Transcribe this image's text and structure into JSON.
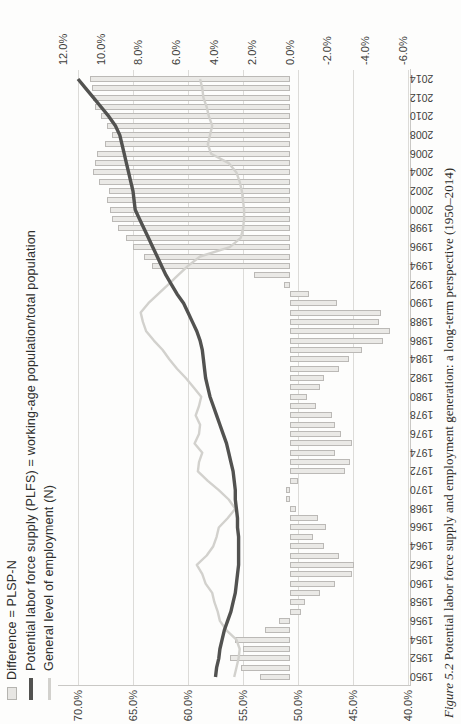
{
  "figure": {
    "caption_label": "Figure 5.2",
    "caption_text": "Potential labor force supply and employment generation: a long-term perspective (1950–2014)"
  },
  "legend": [
    {
      "label": "Difference = PLSP-N",
      "marker": "bar-swatch"
    },
    {
      "label": "Potential labor force supply (PLFS) = working-age population/total population",
      "marker": "thick-line"
    },
    {
      "label": "General level of employment (N)",
      "marker": "thin-line"
    }
  ],
  "chart_data": {
    "type": "bar",
    "subtype": "bar-line-combo",
    "orientation": "figure rotated 90deg counter-clockwise on portrait book page",
    "title": "",
    "xlabel": "",
    "ylabel_left": "",
    "ylabel_right": "",
    "grid": "vertical gridlines at left-axis ticks only",
    "legend_position": "top-left",
    "x": [
      1950,
      1951,
      1952,
      1953,
      1954,
      1955,
      1956,
      1957,
      1958,
      1959,
      1960,
      1961,
      1962,
      1963,
      1964,
      1965,
      1966,
      1967,
      1968,
      1969,
      1970,
      1971,
      1972,
      1973,
      1974,
      1975,
      1976,
      1977,
      1978,
      1979,
      1980,
      1981,
      1982,
      1983,
      1984,
      1985,
      1986,
      1987,
      1988,
      1989,
      1990,
      1991,
      1992,
      1993,
      1994,
      1995,
      1996,
      1997,
      1998,
      1999,
      2000,
      2001,
      2002,
      2003,
      2004,
      2005,
      2006,
      2007,
      2008,
      2009,
      2010,
      2011,
      2012,
      2013,
      2014
    ],
    "x_axis": {
      "tick_years": [
        1950,
        1952,
        1954,
        1956,
        1958,
        1960,
        1962,
        1964,
        1966,
        1968,
        1970,
        1972,
        1974,
        1976,
        1978,
        1980,
        1982,
        1984,
        1986,
        1988,
        1990,
        1992,
        1994,
        1996,
        1998,
        2000,
        2002,
        2004,
        2006,
        2008,
        2010,
        2012,
        2014
      ],
      "tick_labels": [
        "1950",
        "1952",
        "1954",
        "1956",
        "1958",
        "1960",
        "1962",
        "1964",
        "1966",
        "1968",
        "1970",
        "1972",
        "1974",
        "1976",
        "1978",
        "1980",
        "1982",
        "1984",
        "1986",
        "1988",
        "1990",
        "1992",
        "1994",
        "1996",
        "1998",
        "2000",
        "2002",
        "2004",
        "2006",
        "2008",
        "2010",
        "2012",
        "2014"
      ]
    },
    "left_axis": {
      "min": 40,
      "max": 70,
      "ticks": [
        70,
        65,
        60,
        55,
        50,
        45,
        40
      ],
      "tick_labels": [
        "70.0%",
        "65.0%",
        "60.0%",
        "55.0%",
        "50.0%",
        "45.0%",
        "40.0%"
      ]
    },
    "right_axis": {
      "min": -6,
      "max": 12,
      "ticks": [
        12,
        10,
        8,
        6,
        4,
        2,
        0,
        -2,
        -4,
        -6
      ],
      "tick_labels": [
        "12.0%",
        "10.0%",
        "8.0%",
        "6.0%",
        "4.0%",
        "2.0%",
        "0.0%",
        "-2.0%",
        "-4.0%",
        "-6.0%"
      ]
    },
    "series": [
      {
        "name": "Difference = PLSP-N",
        "type": "bar",
        "axis": "right",
        "values": [
          1.6,
          2.6,
          3.2,
          2.5,
          2.9,
          1.3,
          0.6,
          -0.6,
          -0.8,
          -1.6,
          -2.4,
          -3.3,
          -3.4,
          -2.6,
          -1.8,
          -1.2,
          -1.9,
          -1.5,
          -0.3,
          0.2,
          0.2,
          -0.4,
          -2.9,
          -3.2,
          -2.4,
          -3.3,
          -2.7,
          -2.4,
          -2.2,
          -1.4,
          -0.9,
          -1.6,
          -1.8,
          -2.6,
          -3.1,
          -3.8,
          -4.9,
          -5.3,
          -4.7,
          -4.8,
          -2.5,
          -1.0,
          0.3,
          1.9,
          7.3,
          7.7,
          8.3,
          8.7,
          9.1,
          9.4,
          9.5,
          9.7,
          9.6,
          10.1,
          10.4,
          10.3,
          10.2,
          9.8,
          9.4,
          9.7,
          10.0,
          10.3,
          10.4,
          10.5,
          10.6
        ]
      },
      {
        "name": "Potential labor force supply (PLFS) = working-age population/total population",
        "type": "line",
        "axis": "left",
        "values": [
          57.5,
          57.4,
          57.2,
          57.1,
          56.9,
          56.7,
          56.4,
          56.1,
          55.9,
          55.7,
          55.6,
          55.5,
          55.4,
          55.4,
          55.4,
          55.4,
          55.5,
          55.5,
          55.6,
          55.7,
          55.7,
          55.8,
          55.9,
          56.1,
          56.3,
          56.5,
          56.8,
          57.1,
          57.4,
          57.7,
          58.0,
          58.2,
          58.4,
          58.5,
          58.6,
          58.7,
          58.9,
          59.2,
          59.6,
          60.0,
          60.4,
          61.0,
          61.5,
          62.0,
          62.4,
          62.8,
          63.2,
          63.6,
          64.0,
          64.4,
          64.8,
          64.9,
          65.0,
          65.2,
          65.4,
          65.6,
          65.8,
          66.0,
          66.2,
          66.6,
          67.2,
          67.9,
          68.6,
          69.3,
          70.0
        ]
      },
      {
        "name": "General level of employment (N)",
        "type": "line",
        "axis": "left",
        "values": [
          55.8,
          55.6,
          55.4,
          55.3,
          55.6,
          56.5,
          57.1,
          57.3,
          57.6,
          57.8,
          58.4,
          58.7,
          59.2,
          58.3,
          57.7,
          57.4,
          57.2,
          56.4,
          55.7,
          56.3,
          57.2,
          58.2,
          59.1,
          59.0,
          58.7,
          59.4,
          59.0,
          58.9,
          59.3,
          59.0,
          58.8,
          59.5,
          60.2,
          61.0,
          61.7,
          62.3,
          63.1,
          63.8,
          64.1,
          64.3,
          63.6,
          62.7,
          61.8,
          60.9,
          60.0,
          58.9,
          56.2,
          55.2,
          55.0,
          54.9,
          54.9,
          55.0,
          55.1,
          55.3,
          55.6,
          56.3,
          57.9,
          58.2,
          58.0,
          57.8,
          58.1,
          58.3,
          58.6,
          58.7,
          58.9
        ]
      }
    ],
    "colors": {
      "bar_fill": "#eae9e6",
      "bar_border": "#94928e",
      "plfs_line": "#525250",
      "employment_line": "#d2d1cd",
      "gridline": "#dcdbd8",
      "label_text": "#3d3d3b",
      "page_background": "#fdfdfc"
    }
  }
}
